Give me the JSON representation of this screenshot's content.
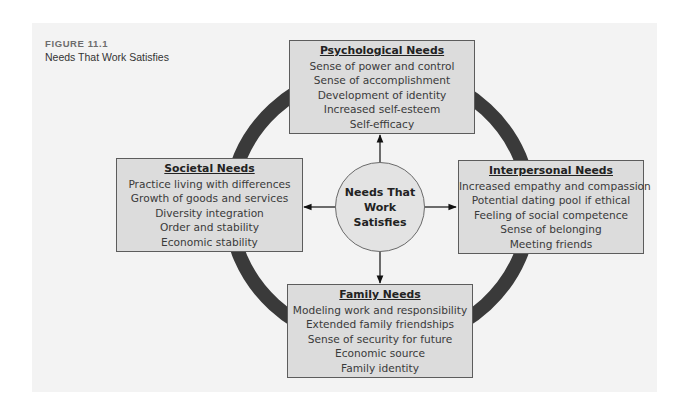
{
  "figure": {
    "label": "FIGURE 11.1",
    "title": "Needs That Work Satisfies"
  },
  "center": {
    "line1": "Needs That",
    "line2": "Work Satisfies"
  },
  "boxes": {
    "psychological": {
      "heading": "Psychological Needs",
      "items": [
        "Sense of power and control",
        "Sense of accomplishment",
        "Development of identity",
        "Increased self-esteem",
        "Self-efficacy"
      ]
    },
    "societal": {
      "heading": "Societal Needs",
      "items": [
        "Practice living with differences",
        "Growth of goods and services",
        "Diversity integration",
        "Order and stability",
        "Economic stability"
      ]
    },
    "interpersonal": {
      "heading": "Interpersonal Needs",
      "items": [
        "Increased empathy and compassion",
        "Potential dating pool if ethical",
        "Feeling of social competence",
        "Sense of belonging",
        "Meeting friends"
      ]
    },
    "family": {
      "heading": "Family Needs",
      "items": [
        "Modeling work and responsibility",
        "Extended family friendships",
        "Sense of security for future",
        "Economic source",
        "Family identity"
      ]
    }
  },
  "colors": {
    "panel_bg": "#f3f3f3",
    "box_bg": "#dcdcdc",
    "ring": "#3a3a3a",
    "center_bg": "#e3e3e3"
  }
}
